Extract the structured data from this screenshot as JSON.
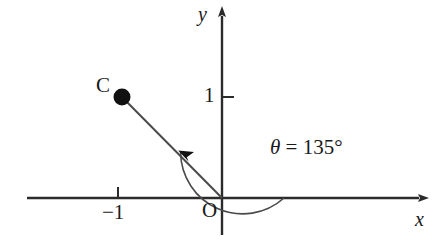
{
  "figure": {
    "kind": "cartesian-angle-diagram",
    "stroke_color": "#2b2b2b",
    "text_color": "#1a1a1a",
    "background": "#ffffff",
    "axes": {
      "x_label": "x",
      "y_label": "y",
      "origin_label": "O",
      "origin_px": {
        "x": 222,
        "y": 198
      },
      "x_axis_px": {
        "x1": 27,
        "x2": 425,
        "y": 198
      },
      "y_axis_px": {
        "x": 222,
        "y1": 10,
        "y2": 235
      }
    },
    "ticks": [
      {
        "name": "y-tick-1",
        "label": "1",
        "axis": "y",
        "value": 1,
        "px": {
          "x": 222,
          "y": 97
        }
      },
      {
        "name": "x-tick-minus-1",
        "label": "−1",
        "axis": "x",
        "value": -1,
        "px": {
          "x": 118,
          "y": 198
        }
      }
    ],
    "points": [
      {
        "name": "C",
        "label": "C",
        "px": {
          "x": 122,
          "y": 97
        },
        "radius_px": 8,
        "filled": true
      }
    ],
    "ray": {
      "from": "O",
      "to": "C",
      "from_px": {
        "x": 222,
        "y": 198
      },
      "to_px": {
        "x": 122,
        "y": 97
      }
    },
    "angle": {
      "label_symbol": "θ",
      "label_equals": " = ",
      "label_value": "135°",
      "label_full": "θ = 135°",
      "degrees": 135,
      "arc_radius_px": 62,
      "arc_start_deg": 0,
      "arc_end_deg": 135,
      "direction": "counterclockwise",
      "arrow_at": "end"
    }
  }
}
